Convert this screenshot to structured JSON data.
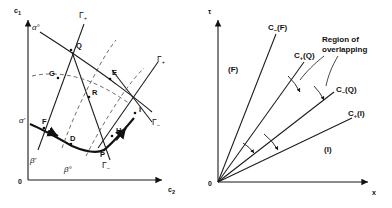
{
  "figure": {
    "panels": [
      {
        "id": "left",
        "name": "concentration-phase-diagram",
        "axes": {
          "origin_label": "0",
          "y_label": "c",
          "y_sub": "1",
          "x_label": "c",
          "x_sub": "2"
        },
        "curve_labels": [
          {
            "key": "alpha_zero",
            "text": "α°"
          },
          {
            "key": "alpha_prime",
            "text": "α'"
          },
          {
            "key": "beta_zero",
            "text": "β°"
          },
          {
            "key": "beta_prime",
            "text": "β'"
          },
          {
            "key": "gamma_plus_top",
            "text": "Γ",
            "sub": "+"
          },
          {
            "key": "gamma_plus_right",
            "text": "Γ",
            "sub": "+"
          },
          {
            "key": "gamma_minus_right",
            "text": "Γ",
            "sub": "−"
          },
          {
            "key": "gamma_minus_bottom",
            "text": "Γ",
            "sub": "−"
          }
        ],
        "points": [
          {
            "key": "Q",
            "text": "Q"
          },
          {
            "key": "E",
            "text": "E"
          },
          {
            "key": "G",
            "text": "G"
          },
          {
            "key": "R",
            "text": "R"
          },
          {
            "key": "I",
            "text": "I"
          },
          {
            "key": "F",
            "text": "F"
          },
          {
            "key": "D",
            "text": "D"
          },
          {
            "key": "P",
            "text": "P"
          },
          {
            "key": "H",
            "text": "H"
          }
        ]
      },
      {
        "id": "right",
        "name": "characteristic-ray-diagram",
        "axes": {
          "origin_label": "0",
          "y_label": "τ",
          "x_label": "x"
        },
        "rays": [
          {
            "key": "c_minus_F",
            "text": "C",
            "sub": "−",
            "arg": "(F)"
          },
          {
            "key": "c_plus_Q",
            "text": "C",
            "sub": "+",
            "arg": "(Q)"
          },
          {
            "key": "c_minus_Q",
            "text": "C",
            "sub": "−",
            "arg": "(Q)"
          },
          {
            "key": "c_plus_I",
            "text": "C",
            "sub": "+",
            "arg": "(I)"
          }
        ],
        "regions": [
          {
            "key": "region_F",
            "text": "(F)"
          },
          {
            "key": "region_I",
            "text": "(I)"
          }
        ],
        "annotation": {
          "line1": "Region of",
          "line2": "overlapping"
        }
      }
    ]
  }
}
